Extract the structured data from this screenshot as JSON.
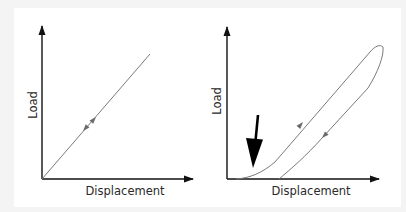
{
  "figure": {
    "panels": [
      {
        "id": "linear-elastic",
        "y_label": "Load",
        "x_label": "Displacement",
        "curve_description": "Straight line from origin; loading and unloading follow same path",
        "arrows": [
          "loading (up-right)",
          "unloading (down-left)"
        ]
      },
      {
        "id": "hysteresis",
        "y_label": "Load",
        "x_label": "Displacement",
        "curve_description": "Hysteresis loop: nonlinear toe region on loading, separate unloading path returning to residual displacement",
        "arrows": [
          "loading (up-right)",
          "unloading (down-left)"
        ],
        "callout": "black arrow pointing to toe region"
      }
    ],
    "colors": {
      "background": "#f4f4f4",
      "panel": "#ffffff",
      "axis": "#111111",
      "curve": "#7a7a7a",
      "text": "#2a2a2a",
      "callout": "#000000"
    }
  }
}
